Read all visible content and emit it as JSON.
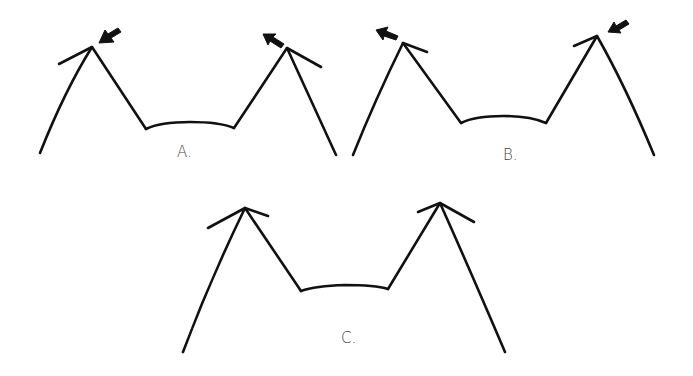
{
  "figures": [
    {
      "id": "A",
      "label": "A.",
      "arrows": [
        "left-peak: pointing inward toward apex",
        "right-peak: pointing outward away from apex"
      ]
    },
    {
      "id": "B",
      "label": "B.",
      "arrows": [
        "left-peak: pointing outward away from apex",
        "right-peak: pointing inward toward apex"
      ]
    },
    {
      "id": "C",
      "label": "C.",
      "arrows": []
    }
  ],
  "colors": {
    "ink": "#111111",
    "label": "#444444",
    "background": "#ffffff"
  }
}
